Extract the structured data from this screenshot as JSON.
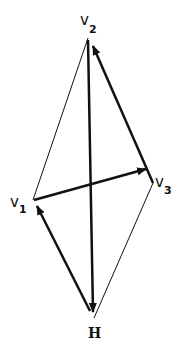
{
  "diagram": {
    "type": "vector-quadrilateral",
    "colors": {
      "stroke": "#111111",
      "background": "#ffffff"
    },
    "vertices": [
      {
        "id": "v2",
        "label": "v",
        "subscript": "2",
        "x": 88,
        "y": 38
      },
      {
        "id": "v3",
        "label": "v",
        "subscript": "3",
        "x": 153,
        "y": 183
      },
      {
        "id": "v1",
        "label": "v",
        "subscript": "1",
        "x": 33,
        "y": 200
      },
      {
        "id": "H",
        "label": "H",
        "subscript": "",
        "x": 94,
        "y": 318
      }
    ],
    "thin_edges": [
      {
        "from": "v1",
        "to": "v2"
      },
      {
        "from": "v3",
        "to": "H"
      }
    ],
    "arrows": [
      {
        "from": "H",
        "to": "v1"
      },
      {
        "from": "v1",
        "to": "v3"
      },
      {
        "from": "v3",
        "to": "v2"
      },
      {
        "from": "v2",
        "to": "H"
      }
    ]
  }
}
